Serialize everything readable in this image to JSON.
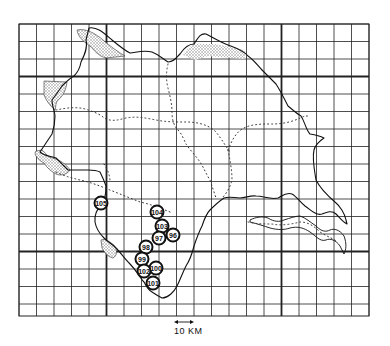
{
  "map": {
    "type": "gridded outline map",
    "grid": {
      "left": 19,
      "top": 24,
      "right": 369,
      "bottom": 316,
      "cell": 17.5,
      "thick_vertical_x": [
        106,
        281
      ],
      "thick_horizontal_y": [
        78,
        252
      ],
      "line_color": "#222222"
    },
    "colors": {
      "background": "#ffffff",
      "ink": "#111111",
      "stipple": "#9a9a9a"
    },
    "sites": [
      {
        "id": "105",
        "label": "105",
        "x": 101,
        "y": 203
      },
      {
        "id": "104",
        "label": "104",
        "x": 157,
        "y": 212
      },
      {
        "id": "103",
        "label": "103",
        "x": 162,
        "y": 226
      },
      {
        "id": "96",
        "label": "96",
        "x": 173,
        "y": 235
      },
      {
        "id": "97",
        "label": "97",
        "x": 159,
        "y": 238
      },
      {
        "id": "98",
        "label": "98",
        "x": 146,
        "y": 247
      },
      {
        "id": "99",
        "label": "99",
        "x": 142,
        "y": 259
      },
      {
        "id": "100",
        "label": "100",
        "x": 156,
        "y": 268
      },
      {
        "id": "102",
        "label": "102",
        "x": 144,
        "y": 271
      },
      {
        "id": "101",
        "label": "101",
        "x": 153,
        "y": 283
      }
    ],
    "scale_bar": {
      "label": "10 KM",
      "x1": 176,
      "x2": 192,
      "y": 322
    }
  }
}
